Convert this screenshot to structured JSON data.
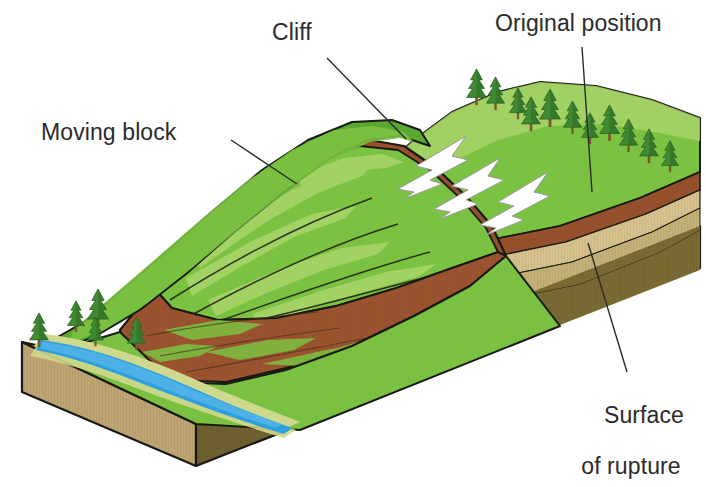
{
  "diagram": {
    "type": "geologic-block-diagram",
    "labels": {
      "cliff": "Cliff",
      "original_position": "Original position",
      "moving_block": "Moving block",
      "surface_of_rupture_line1": "Surface",
      "surface_of_rupture_line2": "of rupture"
    },
    "colors": {
      "background": "#ffffff",
      "outline": "#1a1a14",
      "text": "#2b2b2b",
      "grass_light": "#a8d468",
      "grass_mid": "#7cc242",
      "grass_dark": "#5aa832",
      "grass_shadow": "#4d9430",
      "soil_red_brown": "#a0522d",
      "soil_brown": "#96512c",
      "soil_brown_dark": "#7d4526",
      "strata_tan": "#d6c08c",
      "strata_khaki": "#c3b077",
      "strata_olive": "#9a8b52",
      "bedrock_olive": "#7a6a33",
      "bedrock_dark": "#6b5c2c",
      "block_face_tan": "#bda472",
      "water_blue": "#2f9fe0",
      "water_blue_light": "#58b6ea",
      "sand_bank": "#cfd98d",
      "tree_green": "#3f8a33",
      "tree_green_dark": "#2f6b28",
      "tree_trunk": "#7a5a2a",
      "arrow_white": "#ffffff",
      "arrow_shadow": "#cfcfcf"
    },
    "arrows": {
      "count": 3,
      "color": "#ffffff",
      "direction": "downslope-left",
      "meaning": "direction of block movement"
    },
    "leader_lines": [
      {
        "name": "cliff",
        "from": [
          327,
          58
        ],
        "to": [
          406,
          139
        ]
      },
      {
        "name": "original-position",
        "from": [
          582,
          47
        ],
        "to": [
          592,
          192
        ]
      },
      {
        "name": "moving-block",
        "from": [
          231,
          140
        ],
        "to": [
          297,
          184
        ]
      },
      {
        "name": "surface-of-rupture",
        "from": [
          627,
          372
        ],
        "to": [
          588,
          243
        ]
      }
    ],
    "strata_order": [
      "vegetated green surface",
      "red-brown soil",
      "tan sediment",
      "khaki sediment",
      "olive bedrock"
    ],
    "tree_count_upper_slope": 11,
    "tree_count_lower_left": 5,
    "river": "meandering blue stream at base of slope"
  }
}
